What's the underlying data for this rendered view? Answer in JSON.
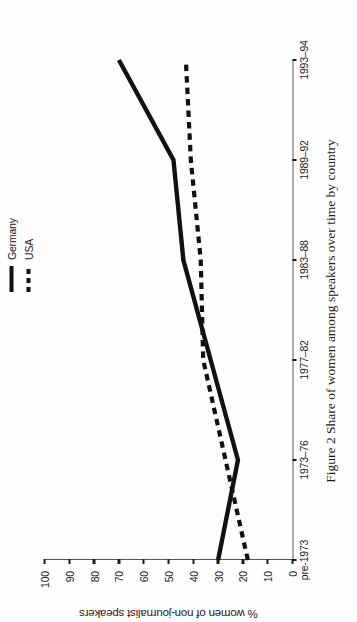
{
  "caption": "Figure 2  Share of women among speakers over time by country",
  "axes": {
    "ylabel": "% women of non-journalist speakers",
    "xlabel": "",
    "yticks": [
      "0",
      "10",
      "20",
      "30",
      "40",
      "50",
      "60",
      "70",
      "80",
      "90",
      "100"
    ],
    "xticks": [
      "pre-1973",
      "1973–76",
      "1977–82",
      "1983–88",
      "1989–92",
      "1993–94"
    ]
  },
  "legend": {
    "position": "top-right",
    "items": [
      {
        "label": "Germany",
        "style": "solid",
        "color": "#111111"
      },
      {
        "label": "USA",
        "style": "dashed",
        "color": "#111111"
      }
    ]
  },
  "chart_data": {
    "type": "line",
    "title": "",
    "subtitle": "",
    "xlabel": "",
    "ylabel": "% women of non-journalist speakers",
    "categories": [
      "pre-1973",
      "1973–76",
      "1977–82",
      "1983–88",
      "1989–92",
      "1993–94"
    ],
    "series": [
      {
        "name": "Germany",
        "style": "solid",
        "color": "#111111",
        "values": [
          30,
          22,
          33,
          44,
          48,
          70
        ]
      },
      {
        "name": "USA",
        "style": "dashed",
        "color": "#111111",
        "values": [
          18,
          27,
          36,
          37,
          41,
          43
        ]
      }
    ],
    "ylim": [
      0,
      100
    ],
    "ytick_step": 10,
    "grid": false,
    "legend_position": "top-right"
  },
  "colors": {
    "ink": "#111111",
    "frame": "#58585a",
    "background": "#ffffff"
  }
}
